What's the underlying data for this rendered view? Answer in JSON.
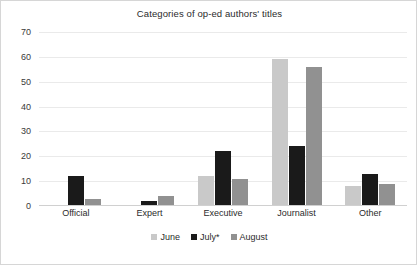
{
  "chart_data": {
    "type": "bar",
    "title": "Categories of op-ed authors' titles",
    "xlabel": "",
    "ylabel": "",
    "categories": [
      "Official",
      "Expert",
      "Executive",
      "Journalist",
      "Other"
    ],
    "series": [
      {
        "name": "June",
        "color": "#c9c9c9",
        "values": [
          0,
          0,
          12,
          59,
          8
        ]
      },
      {
        "name": "July*",
        "color": "#1a1a1a",
        "values": [
          12,
          2,
          22,
          24,
          13
        ]
      },
      {
        "name": "August",
        "color": "#919191",
        "values": [
          3,
          4,
          11,
          56,
          9
        ]
      }
    ],
    "ylim": [
      0,
      70
    ],
    "ytick_step": 10,
    "yticks": [
      70,
      60,
      50,
      40,
      30,
      20,
      10,
      0
    ],
    "grid": true,
    "legend_position": "bottom-center"
  }
}
